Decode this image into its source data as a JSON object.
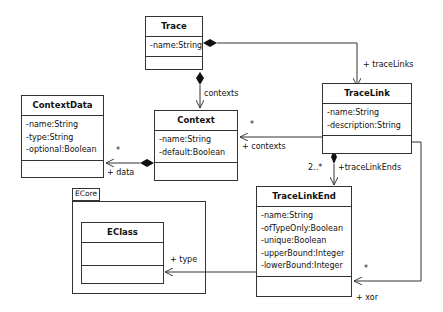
{
  "diagram": {
    "type": "uml-class-diagram",
    "package": {
      "name": "ECore"
    },
    "classes": [
      {
        "id": "trace",
        "name": "Trace",
        "attributes": [
          "-name:String"
        ]
      },
      {
        "id": "tracelink",
        "name": "TraceLink",
        "attributes": [
          "-name:String",
          "-description:String"
        ]
      },
      {
        "id": "contextdata",
        "name": "ContextData",
        "attributes": [
          "-name:String",
          "-type:String",
          "-optional:Boolean"
        ]
      },
      {
        "id": "context",
        "name": "Context",
        "attributes": [
          "-name:String",
          "-default:Boolean"
        ]
      },
      {
        "id": "tracelinkend",
        "name": "TraceLinkEnd",
        "attributes": [
          "-name:String",
          "-ofTypeOnly:Boolean",
          "-unique:Boolean",
          "-upperBound:Integer",
          "-lowerBound:Integer"
        ]
      },
      {
        "id": "eclass",
        "name": "EClass",
        "attributes": []
      }
    ],
    "associations": [
      {
        "from": "Trace",
        "to": "TraceLink",
        "kind": "composition",
        "role": "+ traceLinks"
      },
      {
        "from": "Trace",
        "to": "Context",
        "kind": "composition",
        "role": "contexts"
      },
      {
        "from": "Context",
        "to": "ContextData",
        "kind": "composition",
        "role": "+ data",
        "multiplicity": "*"
      },
      {
        "from": "TraceLink",
        "to": "Context",
        "kind": "association",
        "role": "+ contexts",
        "multiplicity": "*"
      },
      {
        "from": "TraceLink",
        "to": "TraceLinkEnd",
        "kind": "composition",
        "role": "+traceLinkEnds",
        "multiplicity": "2..*"
      },
      {
        "from": "TraceLinkEnd",
        "to": "EClass",
        "kind": "association",
        "role": "+ type"
      },
      {
        "from": "TraceLink",
        "to": "TraceLinkEnd",
        "kind": "association",
        "role": "+ xor",
        "multiplicity": "*"
      }
    ]
  }
}
